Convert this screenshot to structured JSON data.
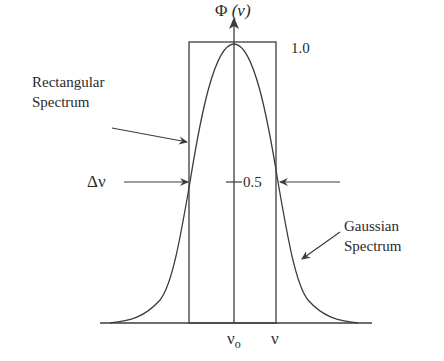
{
  "diagram": {
    "type": "spectral-line-shape comparison",
    "axis_label": {
      "symbol": "Φ",
      "arg": "(ν)"
    },
    "peak_label": "1.0",
    "half_label": "0.5",
    "width_label": "Δν",
    "rect_label": {
      "line1": "Rectangular",
      "line2": "Spectrum"
    },
    "gauss_label": {
      "line1": "Gaussian",
      "line2": "Spectrum"
    },
    "x_center_label": {
      "base": "ν",
      "sub": "o"
    },
    "x_label": "ν",
    "colors": {
      "stroke": "#3c3c3c",
      "text": "#2a2a2a",
      "background": "#ffffff"
    }
  }
}
